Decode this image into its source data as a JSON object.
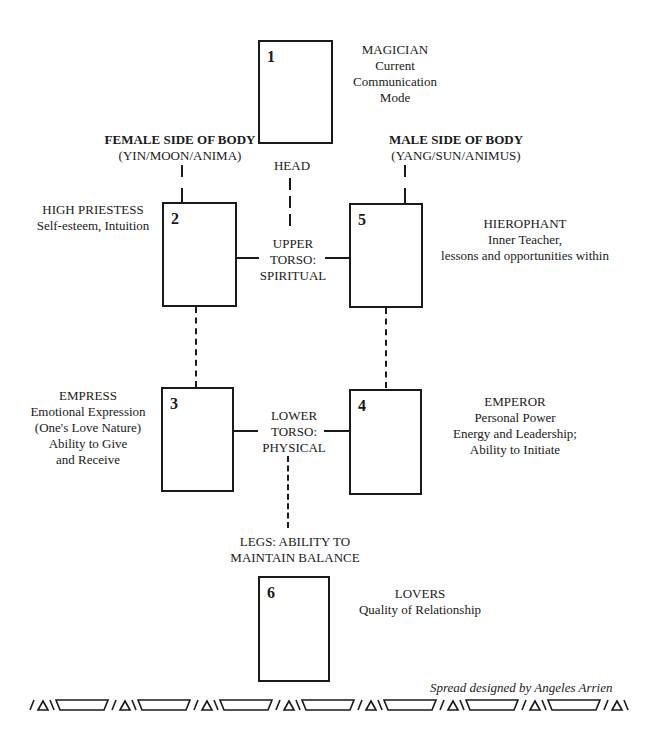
{
  "diagram": {
    "cards": [
      {
        "number": "1",
        "name": "MAGICIAN",
        "meaning": [
          "Current",
          "Communication",
          "Mode"
        ]
      },
      {
        "number": "2",
        "name": "HIGH PRIESTESS",
        "meaning": [
          "Self-esteem, Intuition"
        ]
      },
      {
        "number": "3",
        "name": "EMPRESS",
        "meaning": [
          "Emotional Expression",
          "(One's Love Nature)",
          "Ability to Give",
          "and Receive"
        ]
      },
      {
        "number": "4",
        "name": "EMPEROR",
        "meaning": [
          "Personal Power",
          "Energy and Leadership;",
          "Ability to Initiate"
        ]
      },
      {
        "number": "5",
        "name": "HIEROPHANT",
        "meaning": [
          "Inner Teacher,",
          "lessons and opportunities within"
        ]
      },
      {
        "number": "6",
        "name": "LOVERS",
        "meaning": [
          "Quality of Relationship"
        ]
      }
    ],
    "sides": {
      "female": {
        "title": "FEMALE SIDE OF BODY",
        "subtitle": "(YIN/MOON/ANIMA)"
      },
      "male": {
        "title": "MALE SIDE OF BODY",
        "subtitle": "(YANG/SUN/ANIMUS)"
      }
    },
    "body_zones": {
      "head": "HEAD",
      "upper_torso": [
        "UPPER",
        "TORSO:",
        "SPIRITUAL"
      ],
      "lower_torso": [
        "LOWER",
        "TORSO:",
        "PHYSICAL"
      ],
      "legs": [
        "LEGS:  ABILITY TO",
        "MAINTAIN BALANCE"
      ]
    },
    "credit": "Spread designed by Angeles Arrien",
    "colors": {
      "ink": "#1a1a1a",
      "paper": "#ffffff"
    }
  }
}
